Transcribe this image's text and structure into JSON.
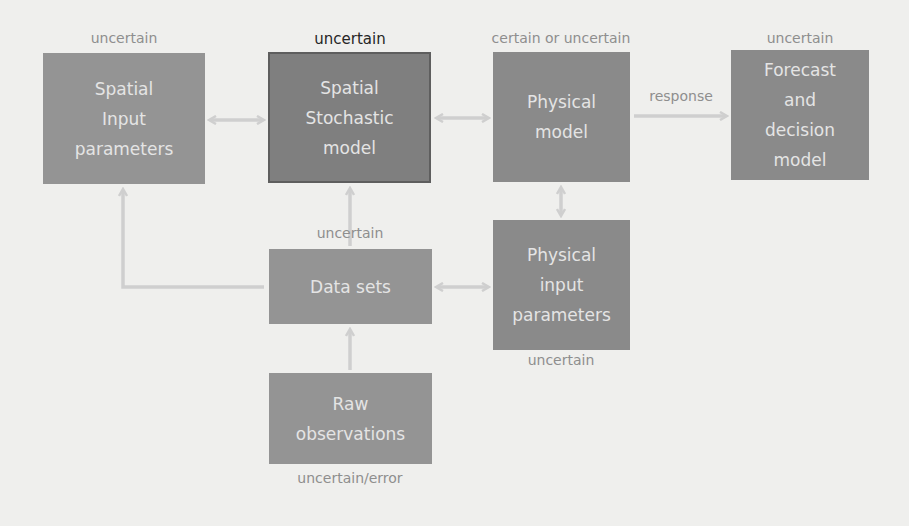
{
  "diagram": {
    "nodes": [
      {
        "id": "spatial-input",
        "label": "Spatial\nInput\nparameters",
        "status": "uncertain"
      },
      {
        "id": "spatial-stochastic",
        "label": "Spatial\nStochastic\nmodel",
        "status": "uncertain"
      },
      {
        "id": "physical-model",
        "label": "Physical\nmodel",
        "status": "certain or uncertain"
      },
      {
        "id": "forecast",
        "label": "Forecast\nand\ndecision\nmodel",
        "status": "uncertain"
      },
      {
        "id": "data-sets",
        "label": "Data sets",
        "status": "uncertain"
      },
      {
        "id": "physical-input",
        "label": "Physical\ninput\nparameters",
        "status": "uncertain"
      },
      {
        "id": "raw-observations",
        "label": "Raw\nobservations",
        "status": "uncertain/error"
      }
    ],
    "edge_labels": {
      "physical_to_forecast": "response"
    },
    "colors": {
      "background": "#efefed",
      "box": "#949494",
      "box_dark": "#7f7f7f",
      "box_text": "#e4e4e4",
      "arrow": "#cfcfcf",
      "label": "#8e8e8e",
      "label_strong": "#262626"
    }
  }
}
